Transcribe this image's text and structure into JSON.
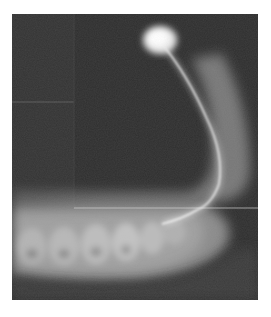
{
  "image": {
    "subject": "radiograph of jaw with bright tracer filament",
    "colors": {
      "background": "#2f2f2f",
      "bone": "#9a9a9a",
      "highlight": "#f4f4f4",
      "page": "#ffffff"
    }
  }
}
